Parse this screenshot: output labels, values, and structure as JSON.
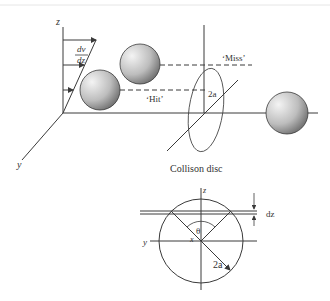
{
  "figure": {
    "top_view": {
      "axis_z_label": "z",
      "axis_y_label": "y",
      "shear_label_numerator": "dv",
      "shear_label_denominator": "dz",
      "miss_label": "‘Miss’",
      "hit_label": "‘Hit’",
      "disc_diameter_label": "2a",
      "disc_caption": "Collison disc"
    },
    "bottom_view": {
      "axis_z_label": "z",
      "axis_y_label": "y",
      "axis_x_label": "x",
      "angle_label": "θ",
      "strip_label": "dz",
      "radius_label": "2a"
    },
    "colors": {
      "line": "#3a3a3a",
      "sphere_light": "#f2f2f2",
      "sphere_dark": "#6a6a6a",
      "background": "#ffffff"
    }
  }
}
